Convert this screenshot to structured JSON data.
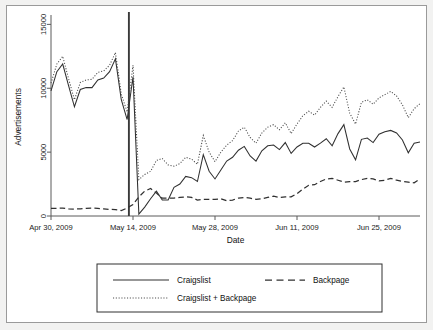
{
  "figure": {
    "background": "#f2f2f1",
    "panel_background": "#ffffff",
    "border_color": "#9a9a9a"
  },
  "chart_data": {
    "type": "line",
    "title": "",
    "xlabel": "Date",
    "ylabel": "Advertisements",
    "ylim": [
      0,
      15500
    ],
    "yticks": [
      0,
      5000,
      10000,
      15000
    ],
    "ytick_labels": [
      "0",
      "5000",
      "10000",
      "15000"
    ],
    "xtick_labels": [
      "Apr 30, 2009",
      "May 14, 2009",
      "May 28, 2009",
      "Jun 11, 2009",
      "Jun 25, 2009"
    ],
    "xtick_indices": [
      0,
      14,
      28,
      42,
      56
    ],
    "x_index_range": [
      0,
      63
    ],
    "grid": false,
    "legend_position": "bottom",
    "annotations": [
      {
        "name": "intervention-vertical-line",
        "type": "vline",
        "x_index": 13.3,
        "label": ""
      }
    ],
    "series": [
      {
        "name": "Craigslist",
        "style": "solid",
        "color": "#303030",
        "values": [
          9800,
          11300,
          11900,
          10200,
          8550,
          9900,
          10050,
          10050,
          10650,
          10800,
          11300,
          12300,
          9100,
          7550,
          10900,
          150,
          700,
          1350,
          1950,
          1250,
          1250,
          2250,
          2500,
          3100,
          3000,
          2700,
          4800,
          3500,
          2900,
          3600,
          4300,
          4600,
          5150,
          5450,
          4700,
          4300,
          5100,
          5500,
          5550,
          5200,
          5750,
          4900,
          5400,
          5700,
          5700,
          5400,
          5700,
          6050,
          5500,
          6450,
          7150,
          5250,
          4400,
          6000,
          6100,
          5750,
          6400,
          6600,
          6700,
          6500,
          5950,
          4950,
          5700,
          5800
        ]
      },
      {
        "name": "Backpage",
        "style": "dashed",
        "color": "#303030",
        "values": [
          600,
          600,
          620,
          560,
          540,
          560,
          600,
          620,
          600,
          560,
          520,
          500,
          430,
          620,
          900,
          1500,
          1950,
          2150,
          1800,
          1400,
          1400,
          1400,
          1450,
          1500,
          1450,
          1250,
          1300,
          1300,
          1300,
          1350,
          1200,
          1250,
          1400,
          1450,
          1400,
          1300,
          1350,
          1450,
          1550,
          1450,
          1500,
          1500,
          1750,
          2100,
          2400,
          2450,
          2700,
          2900,
          2950,
          2800,
          2650,
          2700,
          2700,
          2850,
          2950,
          2900,
          2750,
          2800,
          2950,
          2800,
          2700,
          2650,
          2600,
          2900
        ]
      },
      {
        "name": "Craigslist + Backpage",
        "style": "dotted",
        "color": "#4a4a4a",
        "values": [
          10400,
          11900,
          12500,
          10750,
          9100,
          10450,
          10650,
          10700,
          11250,
          11350,
          11800,
          12800,
          9550,
          8150,
          11800,
          2850,
          3250,
          3500,
          4350,
          4500,
          4000,
          3900,
          4100,
          4600,
          4450,
          4050,
          6300,
          5000,
          4250,
          5000,
          5550,
          5900,
          6650,
          6950,
          6150,
          5700,
          6500,
          6950,
          7150,
          6750,
          7300,
          6450,
          7200,
          7850,
          8200,
          7900,
          8500,
          9000,
          8500,
          9350,
          10100,
          8050,
          7200,
          8900,
          9100,
          8750,
          9250,
          9500,
          9750,
          9400,
          8700,
          7700,
          8400,
          8800
        ]
      }
    ]
  },
  "legend": {
    "entries": [
      {
        "label": "Craigslist",
        "style": "solid"
      },
      {
        "label": "Backpage",
        "style": "dashed"
      },
      {
        "label": "Craigslist + Backpage",
        "style": "dotted"
      }
    ]
  }
}
